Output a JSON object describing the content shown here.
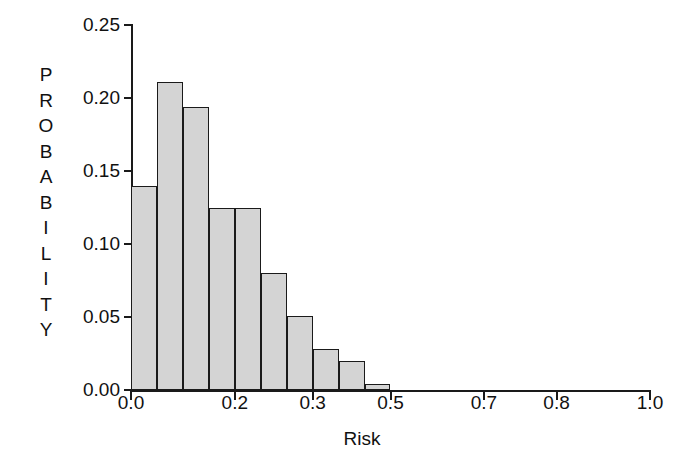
{
  "chart_data": {
    "type": "bar",
    "title": "",
    "subtitle": "",
    "xlabel": "Risk",
    "ylabel": "PROBABILITY",
    "ylabel_letters": [
      "P",
      "R",
      "O",
      "B",
      "A",
      "B",
      "I",
      "L",
      "I",
      "T",
      "Y"
    ],
    "categories": [
      "0.00-0.05",
      "0.05-0.10",
      "0.10-0.15",
      "0.15-0.20",
      "0.20-0.25",
      "0.25-0.30",
      "0.30-0.35",
      "0.35-0.40",
      "0.40-0.45",
      "0.45-0.50"
    ],
    "bin_starts": [
      0.0,
      0.05,
      0.1,
      0.15,
      0.2,
      0.25,
      0.3,
      0.35,
      0.4,
      0.45
    ],
    "bin_width": 0.05,
    "values": [
      0.14,
      0.211,
      0.194,
      0.125,
      0.125,
      0.08,
      0.051,
      0.028,
      0.02,
      0.004
    ],
    "xlim": [
      0.0,
      1.0
    ],
    "ylim": [
      0.0,
      0.25
    ],
    "yticks": [
      0.0,
      0.05,
      0.1,
      0.15,
      0.2,
      0.25
    ],
    "ytick_labels": [
      "0.00",
      "0.05",
      "0.10",
      "0.15",
      "0.20",
      "0.25"
    ],
    "xtick_positions": [
      0.0,
      0.2,
      0.35,
      0.5,
      0.68,
      0.82,
      1.0
    ],
    "xtick_labels": [
      "0.0",
      "0.2",
      "0.3",
      "0.5",
      "0.7",
      "0.8",
      "1.0"
    ],
    "grid": false,
    "legend": false,
    "bar_fill_color": "#d4d4d4",
    "bar_edge_color": "#1a1a1a",
    "background_color": "#ffffff",
    "axis_color": "#1a1a1a"
  }
}
